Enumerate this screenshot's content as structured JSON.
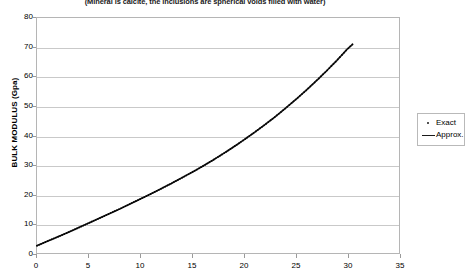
{
  "chart_data": {
    "type": "line",
    "title": "(Mineral is calcite, the inclusions are spherical voids filled with water)",
    "xlabel": "",
    "ylabel": "BULK MODULUS (Gpa)",
    "xlim": [
      0,
      35
    ],
    "ylim": [
      0,
      80
    ],
    "grid": true,
    "legend_position": "right",
    "x_ticks": [
      "0",
      "5",
      "10",
      "15",
      "20",
      "25",
      "30",
      "35"
    ],
    "y_ticks": [
      "0",
      "10",
      "20",
      "30",
      "40",
      "50",
      "60",
      "70",
      "80"
    ],
    "x_tick_values": [
      0,
      5,
      10,
      15,
      20,
      25,
      30,
      35
    ],
    "y_tick_values": [
      0,
      10,
      20,
      30,
      40,
      50,
      60,
      70,
      80
    ],
    "series": [
      {
        "name": "Exact",
        "marker": "dot",
        "color": "#1a1a1a",
        "x": [
          0,
          1,
          2,
          3,
          4,
          5,
          6,
          7,
          8,
          9,
          10,
          11,
          12,
          13,
          14,
          15,
          16,
          17,
          18,
          19,
          20,
          21,
          22,
          23,
          24,
          25,
          26,
          27,
          28,
          29,
          30,
          30.5
        ],
        "values": [
          2.5,
          4.0,
          5.5,
          7.0,
          8.6,
          10.2,
          11.8,
          13.4,
          15.0,
          16.7,
          18.4,
          20.1,
          21.9,
          23.7,
          25.6,
          27.5,
          29.5,
          31.6,
          33.8,
          36.1,
          38.5,
          41.0,
          43.6,
          46.3,
          49.2,
          52.2,
          55.3,
          58.6,
          62.0,
          65.6,
          69.4,
          71.0
        ]
      },
      {
        "name": "Approx.",
        "marker": "line",
        "color": "#1a1a1a",
        "x": [
          0,
          1,
          2,
          3,
          4,
          5,
          6,
          7,
          8,
          9,
          10,
          11,
          12,
          13,
          14,
          15,
          16,
          17,
          18,
          19,
          20,
          21,
          22,
          23,
          24,
          25,
          26,
          27,
          28,
          29,
          30,
          30.5
        ],
        "values": [
          2.5,
          4.0,
          5.5,
          7.0,
          8.6,
          10.2,
          11.8,
          13.4,
          15.0,
          16.7,
          18.4,
          20.1,
          21.9,
          23.7,
          25.6,
          27.5,
          29.5,
          31.6,
          33.8,
          36.1,
          38.5,
          41.0,
          43.6,
          46.3,
          49.2,
          52.2,
          55.3,
          58.6,
          62.0,
          65.6,
          69.4,
          71.0
        ]
      }
    ]
  },
  "legend": {
    "items": [
      {
        "label": "Exact"
      },
      {
        "label": "Approx."
      }
    ]
  },
  "colors": {
    "curve": "#1a1a1a",
    "grid": "#c9c9c9",
    "axis": "#b5b5b5",
    "background": "#ffffff"
  }
}
